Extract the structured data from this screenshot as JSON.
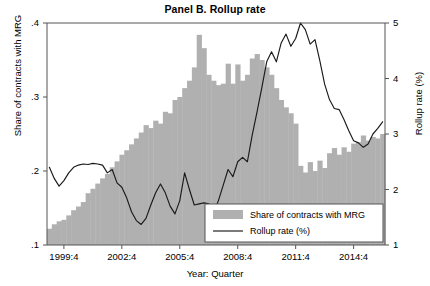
{
  "chart_data": {
    "type": "bar",
    "title": "Panel B. Rollup rate",
    "xlabel": "Year: Quarter",
    "ylabel": "Share of contracts with MRG",
    "ylabel_right": "Rollup rate (%)",
    "grid": false,
    "legend_position": "bottom-right",
    "ylim": [
      0.1,
      0.4
    ],
    "ylim_right": [
      1,
      5
    ],
    "yticks": [
      ".1",
      ".2",
      ".3",
      ".4"
    ],
    "ytick_values": [
      0.1,
      0.2,
      0.3,
      0.4
    ],
    "yticks_right": [
      "1",
      "2",
      "3",
      "4",
      "5"
    ],
    "ytick_values_right": [
      1,
      2,
      3,
      4,
      5
    ],
    "xticks": [
      "1999:4",
      "2002:4",
      "2005:4",
      "2008:4",
      "2011:4",
      "2014:4"
    ],
    "xtick_indices": [
      3,
      15,
      27,
      39,
      51,
      63
    ],
    "x_start_label": "1999:1",
    "x_end_label": "2016:2",
    "bar_color": "#b0b0b0",
    "line_color": "#1a1a1a",
    "series": [
      {
        "name": "Share of contracts with MRG",
        "kind": "bar",
        "axis": "left",
        "values": [
          0.122,
          0.128,
          0.132,
          0.134,
          0.14,
          0.147,
          0.152,
          0.158,
          0.17,
          0.176,
          0.183,
          0.19,
          0.196,
          0.205,
          0.213,
          0.222,
          0.228,
          0.236,
          0.244,
          0.252,
          0.262,
          0.258,
          0.268,
          0.264,
          0.28,
          0.278,
          0.296,
          0.3,
          0.312,
          0.322,
          0.34,
          0.384,
          0.366,
          0.33,
          0.322,
          0.316,
          0.318,
          0.345,
          0.318,
          0.344,
          0.322,
          0.33,
          0.352,
          0.358,
          0.35,
          0.34,
          0.33,
          0.312,
          0.296,
          0.286,
          0.278,
          0.264,
          0.207,
          0.198,
          0.212,
          0.2,
          0.214,
          0.204,
          0.224,
          0.231,
          0.222,
          0.232,
          0.226,
          0.237,
          0.239,
          0.248,
          0.241,
          0.246,
          0.244,
          0.25
        ]
      },
      {
        "name": "Rollup rate (%)",
        "kind": "line",
        "axis": "right",
        "values": [
          2.4,
          2.2,
          2.06,
          2.16,
          2.3,
          2.4,
          2.44,
          2.46,
          2.45,
          2.47,
          2.46,
          2.44,
          2.3,
          2.36,
          2.12,
          2.04,
          1.85,
          1.6,
          1.44,
          1.37,
          1.48,
          1.72,
          1.94,
          2.1,
          1.94,
          1.7,
          1.56,
          1.8,
          2.3,
          2.0,
          1.72,
          1.74,
          1.76,
          1.74,
          1.58,
          1.8,
          2.08,
          2.36,
          2.23,
          2.5,
          2.58,
          2.5,
          2.98,
          3.4,
          3.84,
          4.3,
          4.48,
          4.3,
          4.64,
          4.8,
          4.58,
          4.72,
          5.0,
          4.88,
          4.62,
          4.7,
          4.32,
          3.9,
          3.62,
          3.46,
          3.44,
          3.26,
          3.06,
          2.88,
          2.84,
          2.76,
          2.82,
          3.0,
          3.1,
          3.22
        ]
      }
    ],
    "legend": [
      {
        "label": "Share of contracts with MRG",
        "marker": "swatch"
      },
      {
        "label": "Rollup rate (%)",
        "marker": "line"
      }
    ]
  }
}
